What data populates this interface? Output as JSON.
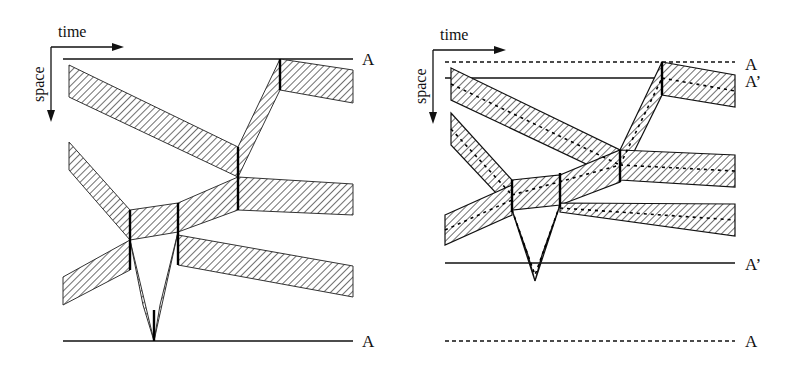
{
  "left_panel": {
    "axis": {
      "x_label": "time",
      "y_label": "space"
    },
    "boundary_labels": {
      "top": "A",
      "bottom": "A"
    },
    "boundary_style": {
      "top": "solid",
      "bottom": "solid"
    }
  },
  "right_panel": {
    "axis": {
      "x_label": "time",
      "y_label": "space"
    },
    "boundary_labels": {
      "top_outer": "A",
      "top_inner": "A’",
      "bottom_inner": "A’",
      "bottom_outer": "A"
    },
    "boundary_style": {
      "top_outer": "dashed",
      "top_inner": "solid",
      "bottom_inner": "solid",
      "bottom_outer": "dashed"
    }
  },
  "colors": {
    "ink": "#111111",
    "hatch": "#333333",
    "background": "#ffffff"
  }
}
